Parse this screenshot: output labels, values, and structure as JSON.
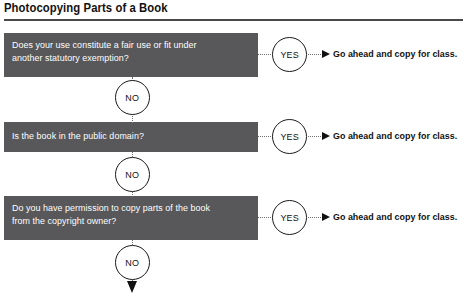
{
  "title": "Photocopying Parts of a Book",
  "flowchart": {
    "type": "decision-flowchart",
    "yes_label": "YES",
    "no_label": "NO",
    "steps": [
      {
        "question": "Does your use constitute a fair use or fit under another statutory exemption?",
        "question_line_1": "Does your use constitute a fair use or fit under",
        "question_line_2": "another statutory exemption?",
        "yes": "YES",
        "yes_outcome": "Go ahead and copy for class.",
        "no": "NO"
      },
      {
        "question": "Is the book in the public domain?",
        "question_line_1": "Is the book in the public domain?",
        "question_line_2": "",
        "yes": "YES",
        "yes_outcome": "Go ahead and copy for class.",
        "no": "NO"
      },
      {
        "question": "Do you have permission to copy parts of the book from the copyright owner?",
        "question_line_1": "Do you have permission to copy parts of the book",
        "question_line_2": "from the copyright owner?",
        "yes": "YES",
        "yes_outcome": "Go ahead and copy for class.",
        "no": "NO"
      }
    ]
  },
  "colors": {
    "box_fill": "#58585a",
    "box_text": "#ffffff",
    "line": "#6f6f6f",
    "arrow": "#111111",
    "rule": "#4a4a4a"
  }
}
